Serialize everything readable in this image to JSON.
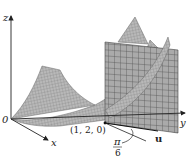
{
  "diagram": {
    "axes": {
      "z_label": "z",
      "x_label": "x",
      "y_label": "y",
      "origin_label": "0"
    },
    "point": {
      "label": "(1, 2, 0)"
    },
    "vector": {
      "label": "u"
    },
    "angle": {
      "numerator": "π",
      "denominator": "6"
    },
    "colors": {
      "surface_fill": "#b5b5b5",
      "surface_grid": "#6e6e6e",
      "plane_fill": "#a8a8a8",
      "plane_grid": "#555555",
      "axis": "#222222"
    }
  }
}
